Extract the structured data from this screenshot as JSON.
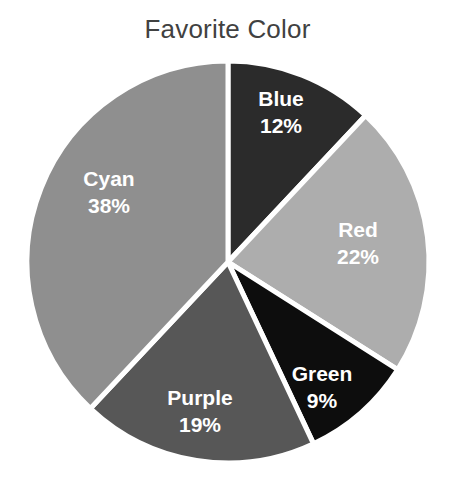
{
  "chart_data": {
    "type": "pie",
    "title": "Favorite Color",
    "xlabel": "",
    "ylabel": "",
    "grid": false,
    "legend": "none",
    "labels_inside_slices": true,
    "start_angle_deg": 90,
    "direction": "clockwise",
    "categories": [
      "Blue",
      "Red",
      "Green",
      "Purple",
      "Cyan"
    ],
    "values": [
      12,
      22,
      9,
      19,
      38
    ],
    "value_suffix": "%",
    "total": 100,
    "slices": [
      {
        "label": "Blue",
        "value": 12,
        "value_text": "12%",
        "color": "#2b2b2b",
        "label_x": 281,
        "label_y": 106,
        "value_x": 281,
        "value_y": 133
      },
      {
        "label": "Red",
        "value": 22,
        "value_text": "22%",
        "color": "#adadad",
        "label_x": 358,
        "label_y": 237,
        "value_x": 358,
        "value_y": 264
      },
      {
        "label": "Green",
        "value": 9,
        "value_text": "9%",
        "color": "#0d0d0d",
        "label_x": 322,
        "label_y": 381,
        "value_x": 322,
        "value_y": 408
      },
      {
        "label": "Purple",
        "value": 19,
        "value_text": "19%",
        "color": "#575757",
        "label_x": 200,
        "label_y": 405,
        "value_x": 200,
        "value_y": 432
      },
      {
        "label": "Cyan",
        "value": 38,
        "value_text": "38%",
        "color": "#8f8f8f",
        "label_x": 109,
        "label_y": 186,
        "value_x": 109,
        "value_y": 213
      }
    ],
    "geometry": {
      "center_x": 228,
      "center_y": 262,
      "radius": 201,
      "separator_color": "#ffffff",
      "separator_width": 5,
      "background": "#ffffff"
    },
    "title_color": "#414141",
    "label_color": "#ffffff"
  }
}
